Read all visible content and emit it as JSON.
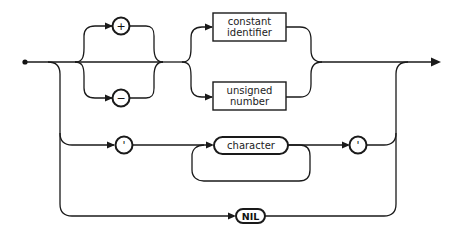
{
  "diagram": {
    "type": "syntax-diagram",
    "title": "",
    "nodes": {
      "plus": {
        "label": "+",
        "kind": "terminal-circle"
      },
      "minus": {
        "label": "−",
        "kind": "terminal-circle"
      },
      "constant_identifier": {
        "line1": "constant",
        "line2": "identifier",
        "kind": "non-terminal-box"
      },
      "unsigned_number": {
        "line1": "unsigned",
        "line2": "number",
        "kind": "non-terminal-box"
      },
      "quote_open": {
        "label": "'",
        "kind": "terminal-circle"
      },
      "character": {
        "label": "character",
        "kind": "rounded-box"
      },
      "quote_close": {
        "label": "'",
        "kind": "terminal-circle"
      },
      "nil": {
        "label": "NIL",
        "kind": "terminal-pill"
      }
    },
    "paths": [
      "start -> (optional + | −) -> (constant identifier | unsigned number) -> end",
      "start -> ' -> character (repeat) -> ' -> end",
      "start -> NIL -> end"
    ],
    "colors": {
      "line": "#1a1a1a",
      "background": "#ffffff"
    }
  }
}
